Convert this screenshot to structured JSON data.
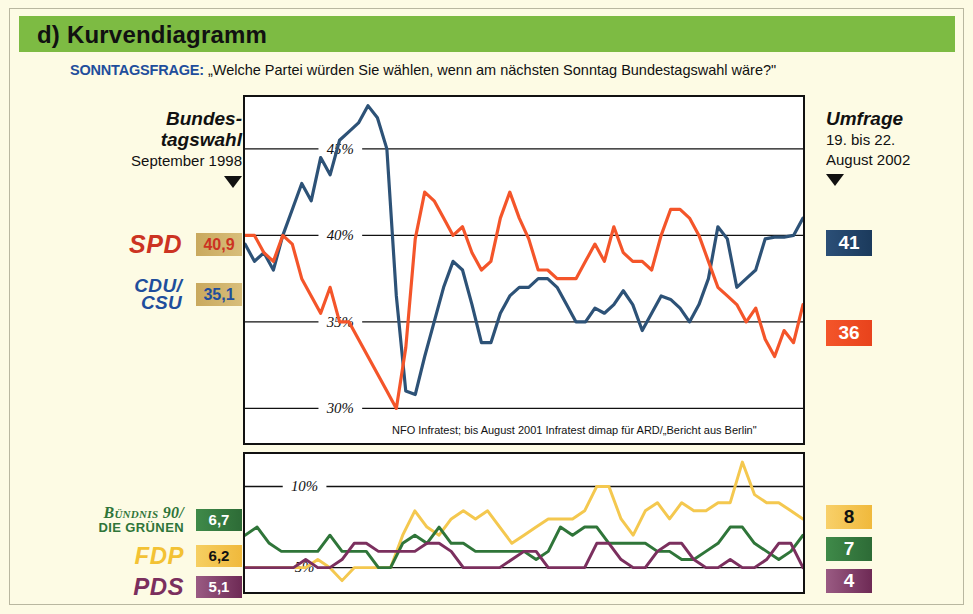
{
  "header": {
    "title": "d) Kurvendiagramm",
    "bar_color": "#7dbb43"
  },
  "subtitle": {
    "lead": "SONNTAGSFRAGE:",
    "question": "„Welche Partei würden Sie wählen, wenn am nächsten Sonntag Bundestagswahl wäre?\""
  },
  "left_header": {
    "line1": "Bundes-",
    "line2": "tagswahl",
    "line3": "September 1998"
  },
  "right_header": {
    "line1": "Umfrage",
    "line2": "19. bis 22.",
    "line3": "August 2002"
  },
  "left_values": {
    "spd": "40,9",
    "cdu_csu": "35,1",
    "gruene": "6,7",
    "fdp": "6,2",
    "pds": "5,1"
  },
  "right_values": {
    "spd": "41",
    "cdu_csu": "36",
    "fdp": "8",
    "gruene": "7",
    "pds": "4"
  },
  "party_logos": {
    "spd": "SPD",
    "cdu_line1": "CDU/",
    "cdu_line2": "CSU",
    "gruene_line1": "Bündnis 90/",
    "gruene_line2": "DIE GRÜNEN",
    "fdp": "FDP",
    "pds": "PDS"
  },
  "source_note": "NFO Infratest; bis August 2001 Infratest dimap für ARD/„Bericht aus Berlin\"",
  "years": [
    "1999",
    "2000",
    "2001",
    "2002"
  ],
  "axis_main": [
    "45%",
    "40%",
    "35%",
    "30%"
  ],
  "axis_small": [
    "10%",
    "5%"
  ],
  "colors": {
    "spd": "#2d5277",
    "cdu_csu": "#f4552a",
    "fdp": "#f4c84f",
    "gruene": "#2f7539",
    "pds": "#7b2f5e",
    "header_green": "#7dbb43",
    "background": "#fdfbe4",
    "accent_blue": "#1f4e9c"
  },
  "chart_data": {
    "type": "line",
    "xlabel": "",
    "ylabel": "Prozent",
    "grid": true,
    "legend": "none",
    "panels": [
      {
        "name": "main",
        "ylim": [
          28,
          48
        ],
        "yticks": [
          30,
          35,
          40,
          45
        ],
        "ytick_labels": [
          "30%",
          "35%",
          "40%",
          "45%"
        ],
        "xlim": [
          "1999-01",
          "2002-08"
        ],
        "xtick_labels": [
          "1999",
          "2000",
          "2001",
          "2002"
        ],
        "series": [
          {
            "name": "SPD",
            "color": "#2d5277",
            "values": [
              39.5,
              38.5,
              39.0,
              38.0,
              40.0,
              41.5,
              43.0,
              42.0,
              44.5,
              43.5,
              45.5,
              46.0,
              46.5,
              47.5,
              46.8,
              45.0,
              36.5,
              31.0,
              30.8,
              33.0,
              35.0,
              37.0,
              38.5,
              38.0,
              36.0,
              33.8,
              33.8,
              35.5,
              36.5,
              37.0,
              37.0,
              37.5,
              37.5,
              37.0,
              36.0,
              35.0,
              35.0,
              35.8,
              35.5,
              36.0,
              36.8,
              36.0,
              34.5,
              35.5,
              36.5,
              36.3,
              35.8,
              35.0,
              36.0,
              37.5,
              40.5,
              39.8,
              37.0,
              37.5,
              38.0,
              39.8,
              39.9,
              39.9,
              40.0,
              41.0
            ]
          },
          {
            "name": "CDU/CSU",
            "color": "#f4552a",
            "values": [
              40.0,
              40.0,
              39.0,
              38.5,
              40.0,
              39.5,
              37.5,
              36.5,
              35.5,
              37.0,
              35.0,
              35.0,
              34.0,
              33.0,
              32.0,
              31.0,
              30.0,
              33.5,
              39.8,
              42.5,
              42.0,
              41.0,
              40.0,
              40.5,
              39.0,
              38.0,
              38.5,
              41.0,
              42.5,
              41.0,
              39.8,
              38.0,
              38.0,
              37.5,
              37.5,
              37.5,
              38.5,
              39.5,
              38.5,
              40.5,
              39.0,
              38.5,
              38.5,
              38.0,
              40.0,
              41.5,
              41.5,
              41.0,
              40.0,
              38.5,
              37.0,
              36.5,
              36.0,
              35.0,
              35.8,
              34.0,
              33.0,
              34.5,
              33.8,
              36.0
            ]
          }
        ]
      },
      {
        "name": "small_parties",
        "ylim": [
          3.5,
          12
        ],
        "yticks": [
          5,
          10
        ],
        "ytick_labels": [
          "5%",
          "10%"
        ],
        "series": [
          {
            "name": "FDP",
            "color": "#f4c84f",
            "values": [
              5.0,
              5.0,
              5.0,
              5.0,
              5.0,
              5.0,
              5.5,
              5.0,
              4.2,
              5.0,
              5.0,
              5.0,
              5.0,
              7.0,
              8.5,
              7.5,
              7.0,
              8.0,
              8.5,
              8.0,
              8.5,
              7.5,
              6.5,
              7.0,
              7.5,
              8.0,
              8.0,
              8.0,
              8.5,
              10.0,
              10.0,
              8.0,
              7.0,
              8.5,
              9.0,
              8.0,
              9.0,
              8.5,
              8.5,
              9.0,
              9.0,
              11.5,
              9.5,
              9.0,
              9.0,
              8.5,
              8.0
            ]
          },
          {
            "name": "Bündnis 90/Die Grünen",
            "color": "#2f7539",
            "values": [
              7.0,
              7.5,
              6.5,
              6.0,
              6.0,
              6.0,
              6.0,
              7.0,
              6.0,
              6.0,
              6.0,
              5.0,
              5.0,
              6.5,
              7.0,
              6.5,
              7.5,
              6.5,
              6.5,
              6.0,
              6.0,
              6.0,
              6.0,
              6.0,
              5.5,
              6.0,
              7.5,
              7.0,
              7.5,
              7.5,
              6.5,
              6.5,
              6.5,
              6.5,
              6.0,
              6.0,
              5.5,
              5.5,
              6.0,
              6.5,
              7.5,
              7.5,
              6.5,
              6.0,
              5.5,
              6.0,
              7.0
            ]
          },
          {
            "name": "PDS",
            "color": "#7b2f5e",
            "values": [
              5.0,
              5.0,
              5.0,
              5.0,
              5.0,
              5.5,
              5.0,
              5.0,
              5.5,
              6.5,
              6.5,
              6.0,
              6.0,
              6.0,
              6.0,
              6.5,
              6.5,
              6.0,
              5.0,
              5.0,
              5.0,
              5.0,
              5.5,
              6.0,
              6.0,
              5.0,
              5.0,
              5.0,
              5.0,
              6.5,
              6.5,
              5.5,
              5.0,
              5.0,
              6.0,
              6.5,
              6.5,
              5.5,
              5.0,
              5.0,
              5.5,
              5.0,
              5.0,
              5.5,
              6.5,
              6.5,
              5.0
            ]
          }
        ]
      }
    ]
  }
}
